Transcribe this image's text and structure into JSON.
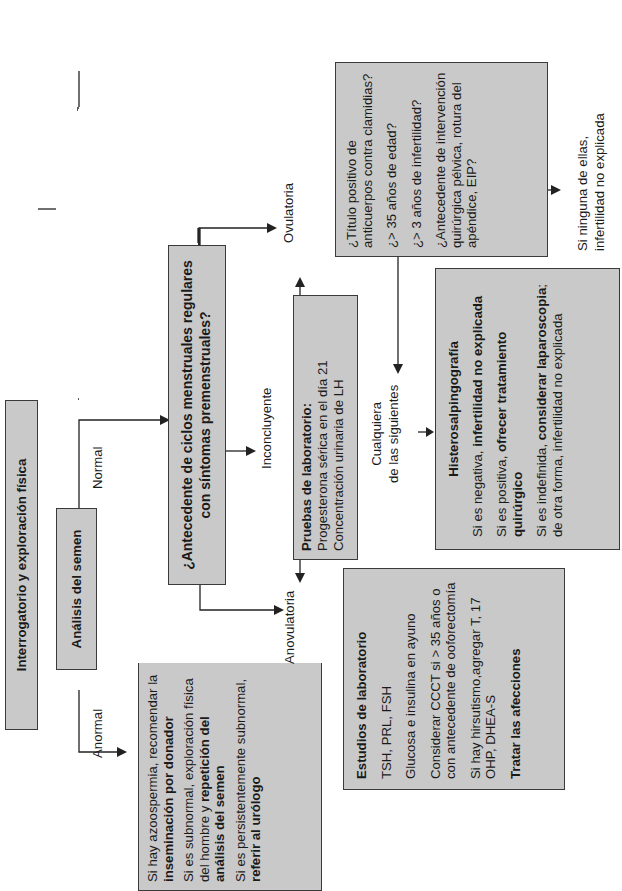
{
  "orientation": "rotated 90 degrees counter-clockwise",
  "boxes": {
    "interrogatorio": {
      "title": "Interrogatorio y exploración física"
    },
    "analisis_semen": {
      "title": "Análisis del semen"
    },
    "anormal_actions": {
      "items": [
        {
          "plain": "Si hay azoospermia, recomendar la ",
          "bold": "inseminación por donador"
        },
        {
          "plain": "Si es subnormal, exploración física del hombre y ",
          "bold": "repetición del análisis del semen"
        },
        {
          "plain": "Si es persistentemente subnormal, ",
          "bold": "referir al urólogo"
        }
      ]
    },
    "ciclos_menstruales": {
      "title": "¿Antecedente de ciclos menstruales regulares con síntomas premenstruales?"
    },
    "pruebas_laboratorio": {
      "title": "Pruebas de laboratorio:",
      "lines": [
        "Progesterona sérica en el día 21",
        "Concentración urinaria de LH"
      ]
    },
    "estudios_laboratorio": {
      "title": "Estudios de laboratorio",
      "lines": [
        "TSH, PRL, FSH",
        "Glucosa e insulina en ayuno",
        "Considerar CCCT si > 35 años o con antecedente de ooforectomía",
        "Si hay hirsutismo,agregar T, 17 OHP, DHEA-S"
      ],
      "footer": "Tratar las afecciones"
    },
    "factores_riesgo": {
      "lines": [
        "¿Título positivo de anticuerpos contra clamidias?",
        "¿> 35 años de edad?",
        "¿> 3 años de infertilidad?",
        "¿Antecedente de intervención quirúrgica pélvica, rotura del apéndice, EIP?"
      ]
    },
    "histerosalpingografia": {
      "title": "Histerosalpingografía",
      "items": [
        {
          "plain": "Si es negativa, ",
          "bold": "infertilidad no explicada",
          "tail": ""
        },
        {
          "plain": "Si es positiva, ",
          "bold": "ofrecer tratamiento quirúrgico",
          "tail": ""
        },
        {
          "plain": "Si es indefinida, ",
          "bold": "considerar laparoscopia",
          "tail": "; de otra forma, infertilidad no explicada"
        }
      ]
    }
  },
  "labels": {
    "normal": "Normal",
    "anormal": "Anormal",
    "ovulatoria": "Ovulatoria",
    "anovulatoria": "Anovulatoria",
    "inconcluyente": "Inconcluyente",
    "cualquiera_1": "Cualquiera",
    "cualquiera_2": "de las siguientes",
    "ninguna_1": "Si ninguna de ellas,",
    "ninguna_2": "infertilidad no explicada"
  },
  "colors": {
    "box_fill": "#c9c9c9",
    "box_border": "#3a3a3a",
    "line": "#222222",
    "text": "#1a1a1a"
  }
}
